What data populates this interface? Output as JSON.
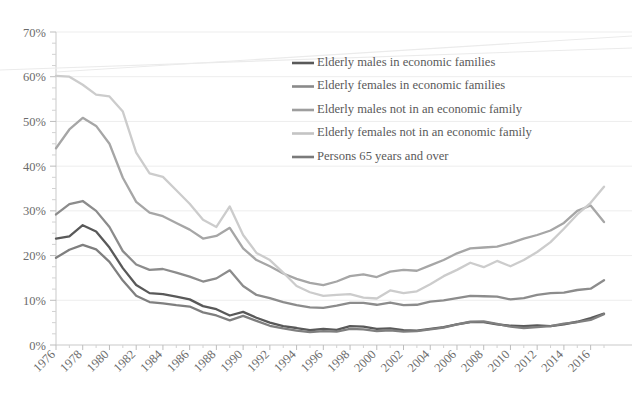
{
  "chart_data": {
    "type": "line",
    "title": "",
    "subtitle": "",
    "xlabel": "",
    "ylabel": "",
    "xlim": [
      1976,
      2017
    ],
    "ylim": [
      0,
      70
    ],
    "y_tick_suffix": "%",
    "y_ticks": [
      0,
      10,
      20,
      30,
      40,
      50,
      60,
      70
    ],
    "y_tick_labels": [
      "0%",
      "10%",
      "20%",
      "30%",
      "40%",
      "50%",
      "60%",
      "70%"
    ],
    "x": [
      1976,
      1977,
      1978,
      1979,
      1980,
      1981,
      1982,
      1983,
      1984,
      1985,
      1986,
      1987,
      1988,
      1989,
      1990,
      1991,
      1992,
      1993,
      1994,
      1995,
      1996,
      1997,
      1998,
      1999,
      2000,
      2001,
      2002,
      2003,
      2004,
      2005,
      2006,
      2007,
      2008,
      2009,
      2010,
      2011,
      2012,
      2013,
      2014,
      2015,
      2016,
      2017
    ],
    "x_tick_labels": [
      "1976",
      "1978",
      "1980",
      "1982",
      "1984",
      "1986",
      "1988",
      "1990",
      "1992",
      "1994",
      "1996",
      "1998",
      "2000",
      "2002",
      "2004",
      "2006",
      "2008",
      "2010",
      "2012",
      "2014",
      "2016"
    ],
    "x_tick_values": [
      1976,
      1978,
      1980,
      1982,
      1984,
      1986,
      1988,
      1990,
      1992,
      1994,
      1996,
      1998,
      2000,
      2002,
      2004,
      2006,
      2008,
      2010,
      2012,
      2014,
      2016
    ],
    "grid": "horizontal",
    "legend_position": "inside-top-right",
    "series": [
      {
        "name": "Elderly males in economic families",
        "color": "#595959",
        "width": 2.3,
        "values": [
          23.8,
          24.3,
          26.8,
          25.4,
          21.8,
          17.2,
          13.4,
          11.6,
          11.4,
          10.8,
          10.2,
          8.7,
          8.0,
          6.6,
          7.4,
          6.1,
          5.0,
          4.2,
          3.8,
          3.3,
          3.6,
          3.4,
          4.2,
          4.1,
          3.6,
          3.7,
          3.3,
          3.2,
          3.6,
          4.0,
          4.6,
          5.1,
          5.1,
          4.6,
          4.3,
          4.2,
          4.4,
          4.2,
          4.6,
          5.2,
          6.0,
          7.0
        ]
      },
      {
        "name": "Elderly females in economic families",
        "color": "#7f7f7f",
        "width": 2.3,
        "values": [
          19.5,
          21.3,
          22.4,
          21.4,
          18.6,
          14.4,
          11.0,
          9.6,
          9.3,
          8.9,
          8.6,
          7.3,
          6.6,
          5.5,
          6.5,
          5.4,
          4.3,
          3.7,
          3.2,
          2.9,
          3.1,
          3.0,
          3.6,
          3.5,
          3.1,
          3.3,
          3.0,
          3.1,
          3.5,
          3.9,
          4.6,
          5.2,
          5.3,
          4.7,
          4.1,
          3.8,
          4.0,
          4.2,
          4.8,
          5.1,
          5.6,
          6.9
        ]
      },
      {
        "name": "Elderly males not in an economic family",
        "color": "#8c8c8c",
        "width": 2.3,
        "values": [
          29.2,
          31.5,
          32.2,
          30.0,
          26.4,
          21.0,
          18.0,
          16.8,
          17.0,
          16.2,
          15.3,
          14.2,
          14.9,
          16.7,
          13.2,
          11.2,
          10.5,
          9.6,
          8.9,
          8.4,
          8.3,
          8.8,
          9.4,
          9.4,
          9.0,
          9.5,
          8.9,
          9.0,
          9.7,
          10.0,
          10.5,
          11.0,
          10.9,
          10.8,
          10.2,
          10.5,
          11.2,
          11.6,
          11.7,
          12.3,
          12.6,
          14.5
        ]
      },
      {
        "name": "Elderly females not in an economic family",
        "color": "#a6a6a6",
        "width": 2.3,
        "values": [
          44.0,
          48.2,
          50.8,
          49.0,
          45.0,
          37.4,
          32.0,
          29.6,
          28.8,
          27.3,
          25.8,
          23.8,
          24.4,
          26.2,
          21.6,
          19.0,
          17.6,
          16.0,
          14.8,
          13.9,
          13.4,
          14.2,
          15.4,
          15.8,
          15.2,
          16.4,
          16.8,
          16.6,
          17.8,
          19.0,
          20.5,
          21.6,
          21.8,
          22.0,
          22.8,
          23.8,
          24.6,
          25.6,
          27.3,
          30.0,
          31.2,
          27.5
        ]
      },
      {
        "name": "Persons 65 years and over",
        "color": "#cccccc",
        "width": 2.3,
        "values": [
          60.2,
          60.0,
          58.2,
          56.0,
          55.6,
          52.2,
          43.0,
          38.4,
          37.6,
          34.6,
          31.6,
          28.0,
          26.4,
          31.0,
          24.6,
          20.6,
          19.0,
          16.2,
          13.2,
          11.8,
          11.0,
          11.2,
          11.4,
          10.6,
          10.4,
          12.2,
          11.6,
          12.0,
          13.6,
          15.4,
          16.8,
          18.4,
          17.4,
          18.8,
          17.6,
          19.0,
          20.8,
          23.0,
          26.0,
          29.2,
          31.8,
          35.4
        ]
      }
    ],
    "legend": [
      {
        "label": "Elderly males in economic families",
        "color": "#595959"
      },
      {
        "label": "Elderly females in economic families",
        "color": "#8a8a8a"
      },
      {
        "label": "Elderly males not in an economic family",
        "color": "#9e9e9e"
      },
      {
        "label": "Elderly females not in an economic family",
        "color": "#c4c4c4"
      },
      {
        "label": "Persons 65 years and over",
        "color": "#7a7a7a"
      }
    ]
  }
}
